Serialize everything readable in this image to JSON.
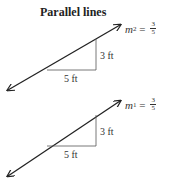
{
  "title": "Parallel lines",
  "lines": [
    {
      "name": "line-2",
      "slope_symbol": "m",
      "slope_subscript": "2",
      "equals": " = ",
      "slope_numerator": "3",
      "slope_denominator": "5",
      "rise_label": "3 ft",
      "run_label": "5 ft"
    },
    {
      "name": "line-1",
      "slope_symbol": "m",
      "slope_subscript": "1",
      "equals": " = ",
      "slope_numerator": "3",
      "slope_denominator": "5",
      "rise_label": "3 ft",
      "run_label": "5 ft"
    }
  ],
  "colors": {
    "line": "#222222",
    "triangle": "#555555",
    "text": "#333333"
  }
}
